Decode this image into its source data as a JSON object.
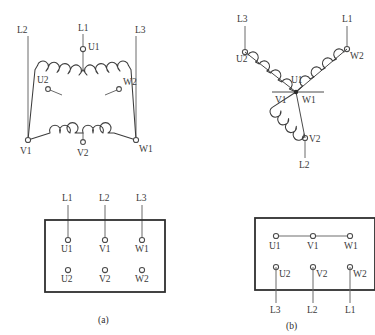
{
  "figure": {
    "caption_a": "(a)",
    "caption_b": "(b)"
  },
  "delta": {
    "name": "delta-connection-diagram",
    "supply_lines": [
      {
        "label": "L2",
        "x": 22,
        "y": 30
      },
      {
        "label": "L1",
        "x": 83,
        "y": 28
      },
      {
        "label": "L3",
        "x": 140,
        "y": 30
      }
    ],
    "terminals": [
      {
        "label": "U1",
        "x": 83,
        "y": 47
      },
      {
        "label": "U2",
        "x": 44,
        "y": 86
      },
      {
        "label": "W2",
        "x": 121,
        "y": 87
      },
      {
        "label": "V1",
        "x": 28,
        "y": 142
      },
      {
        "label": "V2",
        "x": 83,
        "y": 145
      },
      {
        "label": "W1",
        "x": 136,
        "y": 142
      }
    ]
  },
  "wye": {
    "name": "wye-connection-diagram",
    "supply_lines": [
      {
        "label": "L3",
        "x": 238,
        "y": 22
      },
      {
        "label": "L1",
        "x": 345,
        "y": 22
      },
      {
        "label": "L2",
        "x": 305,
        "y": 155
      }
    ],
    "terminals": [
      {
        "label": "U2",
        "x": 240,
        "y": 55
      },
      {
        "label": "W2",
        "x": 342,
        "y": 52
      },
      {
        "label": "U1",
        "x": 295,
        "y": 80
      },
      {
        "label": "V1",
        "x": 283,
        "y": 98
      },
      {
        "label": "W1",
        "x": 310,
        "y": 98
      },
      {
        "label": "V2",
        "x": 303,
        "y": 138
      }
    ]
  },
  "terminal_box_a": {
    "name": "terminal-box-delta",
    "top_labels": [
      "L1",
      "L2",
      "L3"
    ],
    "row_top": [
      "U1",
      "V1",
      "W1"
    ],
    "row_bottom": [
      "U2",
      "V2",
      "W2"
    ],
    "has_jumper": "no"
  },
  "terminal_box_b": {
    "name": "terminal-box-wye",
    "row_top": [
      "U1",
      "V1",
      "W1"
    ],
    "row_bottom": [
      "U2",
      "V2",
      "W2"
    ],
    "bottom_labels": [
      "L3",
      "L2",
      "L1"
    ],
    "has_jumper": "yes"
  },
  "colors": {
    "wire": "#6b6b6b",
    "coil": "#3d3d3d",
    "box_border": "#2f2f2f",
    "text": "#3a3a3a",
    "background": "#ffffff"
  }
}
